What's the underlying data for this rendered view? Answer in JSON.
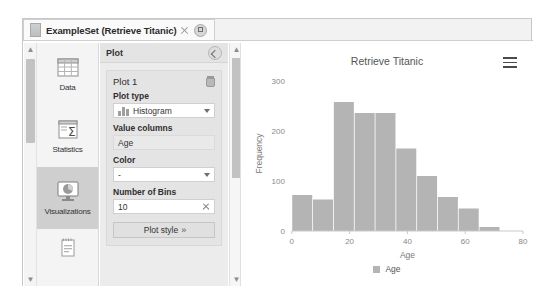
{
  "window": {
    "tab_title": "ExampleSet (Retrieve Titanic)",
    "tab_icon": "table-icon",
    "close_icon": "close-icon",
    "detach_icon": "detach-icon"
  },
  "sidebar": {
    "scroll_up_icon": "chevron-up-icon",
    "scroll_down_icon": "chevron-down-icon",
    "items": [
      {
        "label": "Data",
        "icon": "table-grid-icon",
        "selected": false
      },
      {
        "label": "Statistics",
        "icon": "sigma-icon",
        "selected": false
      },
      {
        "label": "Visualizations",
        "icon": "chart-monitor-icon",
        "selected": true
      },
      {
        "label": "",
        "icon": "annotations-icon",
        "selected": false
      }
    ]
  },
  "plot_panel": {
    "header": "Plot",
    "collapse_icon": "collapse-icon",
    "plot_name": "Plot 1",
    "delete_icon": "trash-icon",
    "plot_type_label": "Plot type",
    "plot_type_value": "Histogram",
    "plot_type_icon": "histogram-icon",
    "value_columns_label": "Value columns",
    "value_columns_value": "Age",
    "color_label": "Color",
    "color_value": "-",
    "bins_label": "Number of Bins",
    "bins_value": "10",
    "bins_clear_icon": "clear-icon",
    "plot_style_button": "Plot style",
    "plot_style_chevrons": "»",
    "dropdown_icon": "chevron-down-icon"
  },
  "chart_panel": {
    "menu_icon": "hamburger-menu-icon"
  },
  "chart_data": {
    "type": "bar",
    "title": "Retrieve Titanic",
    "xlabel": "Age",
    "ylabel": "Frequency",
    "xlim": [
      0,
      80
    ],
    "ylim": [
      0,
      310
    ],
    "xticks": [
      0,
      20,
      40,
      60,
      80
    ],
    "yticks": [
      0,
      100,
      200,
      300
    ],
    "grid": false,
    "legend": [
      {
        "name": "Age",
        "color": "#b4b4b4"
      }
    ],
    "legend_position": "bottom",
    "bin_width": 7.2,
    "bin_edges": [
      0,
      7.2,
      14.4,
      21.6,
      28.8,
      36.0,
      43.2,
      50.4,
      57.6,
      64.8,
      72.0
    ],
    "categories": [
      "0-7.2",
      "7.2-14.4",
      "14.4-21.6",
      "21.6-28.8",
      "28.8-36.0",
      "36.0-43.2",
      "43.2-50.4",
      "50.4-57.6",
      "57.6-64.8",
      "64.8-72.0"
    ],
    "values": [
      72,
      63,
      258,
      236,
      236,
      165,
      110,
      68,
      45,
      8
    ],
    "bar_color": "#b4b4b4"
  }
}
